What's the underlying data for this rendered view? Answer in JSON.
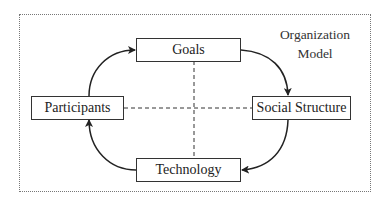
{
  "diagram": {
    "title_line1": "Organization",
    "title_line2": "Model",
    "nodes": {
      "goals": "Goals",
      "participants": "Participants",
      "social_structure": "Social Structure",
      "technology": "Technology"
    },
    "edges": [
      {
        "from": "Participants",
        "to": "Goals",
        "style": "solid-curved-arrow"
      },
      {
        "from": "Goals",
        "to": "Social Structure",
        "style": "solid-curved-arrow"
      },
      {
        "from": "Social Structure",
        "to": "Technology",
        "style": "solid-curved-arrow"
      },
      {
        "from": "Technology",
        "to": "Participants",
        "style": "solid-curved-arrow"
      },
      {
        "from": "Goals",
        "to": "Technology",
        "style": "dashed-line"
      },
      {
        "from": "Participants",
        "to": "Social Structure",
        "style": "dashed-line"
      }
    ],
    "colors": {
      "line": "#222222",
      "border": "#333333",
      "frame": "#777777"
    }
  }
}
